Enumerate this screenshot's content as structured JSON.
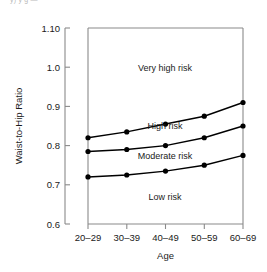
{
  "figure": {
    "top_partial_text": "y) y    g   —",
    "background": "#ffffff",
    "line_color": "#000000",
    "axis_color": "#808080"
  },
  "chart_data": {
    "type": "line",
    "title": "",
    "xlabel": "Age",
    "ylabel": "Waist-to-Hip Ratio",
    "categories": [
      "20–29",
      "30–39",
      "40–49",
      "50–59",
      "60–69"
    ],
    "x_tick_labels": [
      "20–29",
      "30–39",
      "40–49",
      "50–59",
      "60–69"
    ],
    "y_tick_labels": [
      "1.10",
      "1.0",
      "0.9",
      "0.8",
      "0.7",
      "0.6"
    ],
    "y_tick_values": [
      1.1,
      1.0,
      0.9,
      0.8,
      0.7,
      0.6
    ],
    "ylim": [
      0.6,
      1.1
    ],
    "grid": false,
    "legend": "none",
    "marker": "filled-circle",
    "series": [
      {
        "name": "High / Very high boundary",
        "values": [
          0.82,
          0.835,
          0.855,
          0.875,
          0.91
        ]
      },
      {
        "name": "Moderate / High boundary",
        "values": [
          0.785,
          0.79,
          0.8,
          0.82,
          0.85
        ]
      },
      {
        "name": "Low / Moderate boundary",
        "values": [
          0.72,
          0.725,
          0.735,
          0.75,
          0.775
        ]
      }
    ],
    "annotations": [
      {
        "text": "Very high risk",
        "x_frac": 0.47,
        "y_value": 1.005
      },
      {
        "text": "High risk",
        "x_frac": 0.47,
        "y_value": 0.805
      },
      {
        "text": "Moderate risk",
        "x_frac": 0.47,
        "y_value": 0.757
      },
      {
        "text": "Low risk",
        "x_frac": 0.47,
        "y_value": 0.675
      }
    ]
  }
}
